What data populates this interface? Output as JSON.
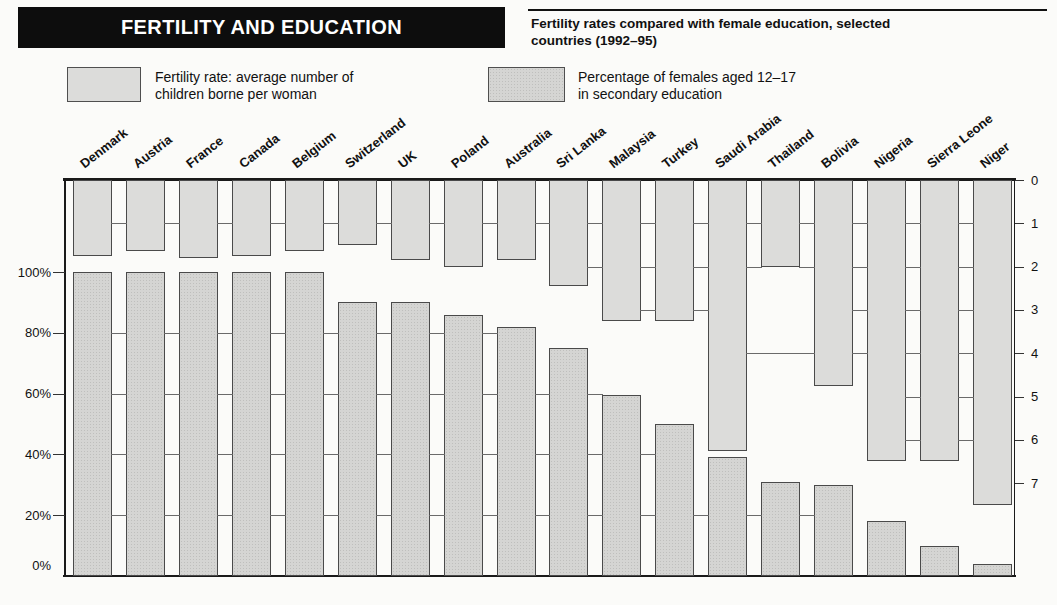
{
  "header": {
    "title": "FERTILITY AND EDUCATION",
    "subtitle_lines": [
      "Fertility rates compared with female education, selected",
      "countries (1992–95)"
    ]
  },
  "legend": {
    "fertility": {
      "line1": "Fertility rate: average number of",
      "line2": "children borne per woman"
    },
    "education": {
      "line1": "Percentage of females aged 12–17",
      "line2": "in secondary education"
    }
  },
  "chart_data": {
    "type": "bar",
    "title": "Fertility rates compared with female education, selected countries (1992–95)",
    "categories": [
      "Denmark",
      "Austria",
      "France",
      "Canada",
      "Belgium",
      "Switzerland",
      "UK",
      "Poland",
      "Australia",
      "Sri Lanka",
      "Malaysia",
      "Turkey",
      "Saudi Arabia",
      "Thailand",
      "Bolivia",
      "Nigeria",
      "Sierra Leone",
      "Niger"
    ],
    "series": [
      {
        "name": "Fertility rate: average number of children borne per woman",
        "axis": "right",
        "direction": "hanging-down-from-top",
        "values": [
          1.75,
          1.65,
          1.8,
          1.75,
          1.65,
          1.5,
          1.85,
          2.0,
          1.85,
          2.45,
          3.25,
          3.25,
          6.25,
          2.0,
          4.75,
          6.5,
          6.5,
          7.5
        ]
      },
      {
        "name": "Percentage of females aged 12–17 in secondary education",
        "axis": "left",
        "direction": "rising-up-from-bottom",
        "values": [
          100,
          100,
          100,
          100,
          100,
          90,
          90,
          86,
          82,
          75,
          59.5,
          50,
          39,
          31,
          30,
          18,
          10,
          4
        ]
      }
    ],
    "left_axis": {
      "unit": "%",
      "tick_labels": [
        "100%",
        "80%",
        "60%",
        "40%",
        "20%",
        "0%"
      ],
      "tick_values": [
        100,
        80,
        60,
        40,
        20,
        0
      ],
      "range": [
        0,
        100
      ]
    },
    "right_axis": {
      "unit": "children per woman",
      "tick_labels": [
        "0",
        "1",
        "2",
        "3",
        "4",
        "5",
        "6",
        "7"
      ],
      "tick_values": [
        0,
        1,
        2,
        3,
        4,
        5,
        6,
        7
      ],
      "range": [
        0,
        7
      ],
      "inverted": true
    },
    "gridlines": {
      "style": "short segments drawn between adjacent bars only where both bars span that level",
      "fertility_levels": [
        1,
        2,
        3,
        4,
        5,
        6,
        7
      ],
      "education_levels": [
        20,
        40,
        60,
        80
      ],
      "extra_segments": [
        {
          "axis": "fertility",
          "level": 4,
          "from_index": 12,
          "to_index": 14
        }
      ]
    },
    "legend_position": "top"
  },
  "colors": {
    "title_bar_bg": "#0d0d0d",
    "title_text": "#ffffff",
    "fertility_bar_fill": "#dcdcda",
    "education_bar_fill": "#d5d5d3",
    "education_bar_dot": "#bfbfbd",
    "bar_border": "#4a4a4a",
    "axis_line": "#1a1a1a",
    "gridline": "#6a6a6a",
    "text": "#111111",
    "page_bg": "#fbfbf9"
  }
}
